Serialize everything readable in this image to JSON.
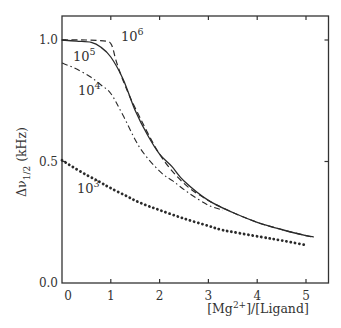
{
  "chart_data": {
    "type": "line",
    "title": "",
    "xlabel": "[Mg2+]/[Ligand]",
    "xlabel_parts": {
      "pre": "[Mg",
      "sup": "2+",
      "post": "]/[Ligand]"
    },
    "ylabel": "Δν1/2 (kHz)",
    "ylabel_parts": {
      "pre": "Δν",
      "sub": "1/2",
      "post": " (kHz)"
    },
    "xlim": [
      0,
      5.45
    ],
    "ylim": [
      0.0,
      1.1
    ],
    "xticks": [
      0,
      1,
      2,
      3,
      4,
      5
    ],
    "xtick_labels": [
      "0",
      "1",
      "2",
      "3",
      "4",
      "5"
    ],
    "yticks": [
      0.0,
      0.5,
      1.0
    ],
    "ytick_labels": [
      "0.0",
      "0.5",
      "1.0"
    ],
    "grid": false,
    "legend": "none (curves labeled inline)",
    "series": [
      {
        "name": "10^6",
        "label_base": "10",
        "label_exp": "6",
        "style": "dashed",
        "x": [
          0,
          0.5,
          0.9,
          1.0,
          1.05,
          1.1,
          1.2,
          1.3,
          1.5,
          2.0,
          2.5,
          3.0,
          3.5,
          4.0,
          4.5,
          5.0,
          5.15
        ],
        "y": [
          1.0,
          1.0,
          0.995,
          0.985,
          0.96,
          0.92,
          0.86,
          0.81,
          0.72,
          0.53,
          0.41,
          0.34,
          0.29,
          0.25,
          0.22,
          0.195,
          0.19
        ]
      },
      {
        "name": "10^5",
        "label_base": "10",
        "label_exp": "5",
        "style": "solid",
        "x": [
          0,
          0.3,
          0.6,
          0.8,
          1.0,
          1.25,
          1.5,
          1.75,
          2.0,
          2.25,
          2.5,
          3.0,
          3.5,
          4.0,
          4.5,
          5.0,
          5.15
        ],
        "y": [
          1.0,
          0.995,
          0.99,
          0.97,
          0.93,
          0.84,
          0.71,
          0.61,
          0.53,
          0.48,
          0.42,
          0.34,
          0.29,
          0.25,
          0.22,
          0.195,
          0.19
        ]
      },
      {
        "name": "10^4",
        "label_base": "10",
        "label_exp": "4",
        "style": "dash-dot",
        "x": [
          0,
          0.25,
          0.57,
          0.8,
          1.0,
          1.25,
          1.6,
          2.0,
          2.27,
          2.6,
          3.0,
          3.3
        ],
        "y": [
          0.905,
          0.885,
          0.85,
          0.815,
          0.78,
          0.69,
          0.555,
          0.46,
          0.42,
          0.37,
          0.32,
          0.3
        ]
      },
      {
        "name": "10^3",
        "label_base": "10",
        "label_exp": "3",
        "style": "dotted",
        "x": [
          0,
          0.2,
          0.5,
          0.78,
          1.0,
          1.3,
          1.6,
          2.0,
          2.5,
          3.0,
          3.24,
          3.5,
          4.06,
          4.5,
          5.02
        ],
        "y": [
          0.505,
          0.48,
          0.445,
          0.415,
          0.39,
          0.36,
          0.33,
          0.3,
          0.265,
          0.235,
          0.22,
          0.21,
          0.19,
          0.175,
          0.155
        ]
      }
    ]
  },
  "colors": {
    "ink": "#2a2a2a",
    "background": "#ffffff"
  }
}
